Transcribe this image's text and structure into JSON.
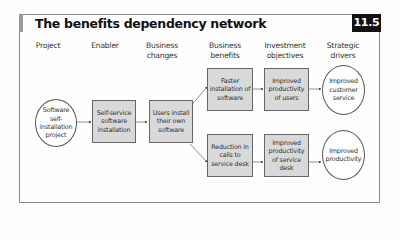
{
  "figure": {
    "title": "The benefits dependency network",
    "badge": "11.5"
  },
  "columns": [
    {
      "label": "Project"
    },
    {
      "label": "Enabler"
    },
    {
      "label": "Business changes"
    },
    {
      "label": "Business benefits"
    },
    {
      "label": "Investment objectives"
    },
    {
      "label": "Strategic drivers"
    }
  ],
  "nodes": {
    "project": "Software self-installation project",
    "enabler": "Self-service software installation",
    "change": "Users install their own software",
    "benefit_1": "Faster installation of software",
    "benefit_2": "Reduction in calls to service desk",
    "objective_1": "Improved productivity of users",
    "objective_2": "Improved productivity of service desk",
    "driver_1": "Improved customer service",
    "driver_2": "Improved productivity"
  },
  "colors": {
    "box_fill": "#d9d9d9",
    "border": "#666666",
    "badge_bg": "#111111",
    "badge_text": "#ffffff"
  }
}
